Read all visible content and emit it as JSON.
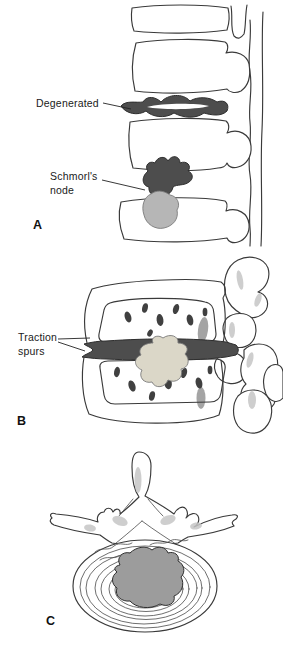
{
  "figure": {
    "labels": {
      "degenerated": "Degenerated",
      "schmorls_node": {
        "line1": "Schmorl's",
        "line2": "node"
      },
      "traction_spurs": {
        "line1": "Traction",
        "line2": "spurs"
      }
    },
    "panels": [
      {
        "letter": "A"
      },
      {
        "letter": "B"
      },
      {
        "letter": "C"
      }
    ],
    "colors": {
      "background": "#ffffff",
      "line": "#3a3a3a",
      "disc_dark": "#4d4d4d",
      "node_light": "#b6b6b6",
      "nucleus_cream": "#dbd7c8",
      "nucleus_gray": "#9c9c9c",
      "bone_shading": "#c6c6c6",
      "deep_shadow": "#9a9a9a",
      "stipple_gray": "#8a8a8a",
      "marrow_spot": "#404040",
      "label_text": "#1a1a1a"
    }
  }
}
